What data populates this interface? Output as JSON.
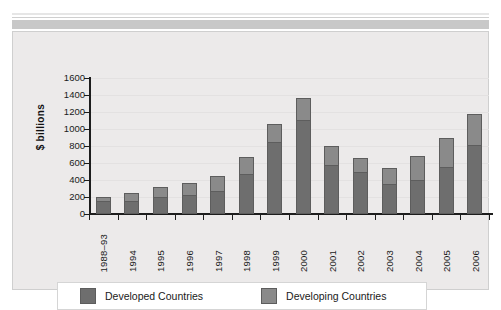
{
  "chart_data": {
    "type": "bar",
    "subtype": "stacked-bar",
    "title": "",
    "xlabel": "",
    "ylabel": "$ billions",
    "ylim": [
      0,
      1600
    ],
    "yticks": [
      0,
      200,
      400,
      600,
      800,
      1000,
      1200,
      1400,
      1600
    ],
    "ytick_labels": [
      "0",
      "200",
      "400",
      "600",
      "800",
      "1000",
      "1200",
      "1400",
      "1600"
    ],
    "grid": true,
    "grid_axis": "y",
    "legend_position": "bottom",
    "categories": [
      "1988–93",
      "1994",
      "1995",
      "1996",
      "1997",
      "1998",
      "1999",
      "2000",
      "2001",
      "2002",
      "2003",
      "2004",
      "2005",
      "2006"
    ],
    "series": [
      {
        "name": "Developed Countries",
        "color": "#6e6e6e",
        "values": [
          150,
          150,
          205,
          225,
          270,
          475,
          845,
          1105,
          580,
          495,
          355,
          405,
          555,
          815
        ]
      },
      {
        "name": "Developing Countries",
        "color": "#8a8a8a",
        "values": [
          50,
          100,
          115,
          140,
          175,
          190,
          210,
          265,
          215,
          170,
          185,
          275,
          335,
          360
        ]
      }
    ],
    "totals": [
      200,
      250,
      320,
      365,
      445,
      665,
      1055,
      1370,
      795,
      665,
      540,
      680,
      890,
      1175
    ]
  },
  "legend": {
    "items": [
      {
        "label": "Developed Countries",
        "swatch_name": "developed-countries-swatch"
      },
      {
        "label": "Developing Countries",
        "swatch_name": "developing-countries-swatch"
      }
    ]
  },
  "axis": {
    "y_title": "$ billions"
  },
  "colors": {
    "developed": "#6e6e6e",
    "developing": "#8a8a8a",
    "panel_background": "#eceaea",
    "axis": "#1d1d1d",
    "gridline": "#e3e1e1",
    "top_band": "#c8c8c8"
  }
}
